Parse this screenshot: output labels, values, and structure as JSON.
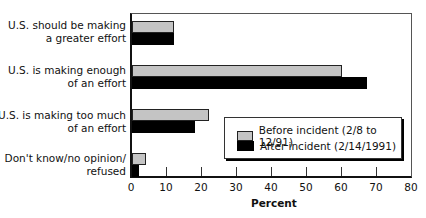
{
  "chart_data": {
    "type": "bar",
    "orientation": "horizontal",
    "title": "",
    "xlabel": "Percent",
    "ylabel": "",
    "xlim": [
      0,
      80
    ],
    "xticks": [
      0,
      10,
      20,
      30,
      40,
      50,
      60,
      70,
      80
    ],
    "grid": false,
    "legend_position": "lower right inside",
    "categories": [
      "U.S. should be making a greater effort",
      "U.S. is making enough of an effort",
      "U.S. is making too much of an effort",
      "Don't know/no opinion/ refused"
    ],
    "series": [
      {
        "name": "Before incident (2/8 to 12/91)",
        "color": "#c4c4c4",
        "values": [
          12,
          60,
          22,
          4
        ]
      },
      {
        "name": "After incident (2/14/1991)",
        "color": "#000000",
        "values": [
          12,
          67,
          18,
          2
        ]
      }
    ]
  },
  "labels": {
    "cat0a": "U.S. should be making",
    "cat0b": "a greater effort",
    "cat1a": "U.S. is making enough",
    "cat1b": "of an effort",
    "cat2a": "U.S. is making too much",
    "cat2b": "of an effort",
    "cat3a": "Don't know/no opinion/",
    "cat3b": "refused",
    "legend0": "Before incident (2/8 to 12/91)",
    "legend1": "After incident (2/14/1991)",
    "xlabel": "Percent",
    "ticks": [
      "0",
      "10",
      "20",
      "30",
      "40",
      "50",
      "60",
      "70",
      "80"
    ]
  }
}
